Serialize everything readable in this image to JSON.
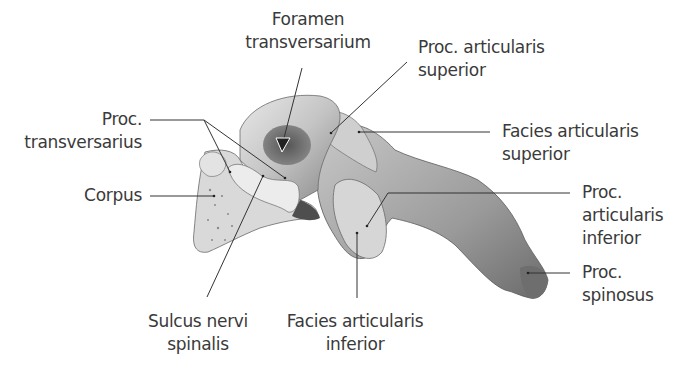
{
  "figure": {
    "colors": {
      "background": "#ffffff",
      "text": "#3a3a3a",
      "leader_line": "#333333",
      "bone_light": "#e6e6e6",
      "bone_mid": "#b8b8b8",
      "bone_dark": "#6e6e6e"
    }
  },
  "labels": {
    "foramen_transversarium": {
      "line1": "Foramen",
      "line2": "transversarium"
    },
    "proc_articularis_superior": {
      "line1": "Proc. articularis",
      "line2": "superior"
    },
    "proc_transversarius": {
      "line1": "Proc.",
      "line2": "transversarius"
    },
    "facies_articularis_superior": {
      "line1": "Facies articularis",
      "line2": "superior"
    },
    "corpus": {
      "line1": "Corpus"
    },
    "proc_articularis_inferior": {
      "line1": "Proc.",
      "line2": "articularis",
      "line3": "inferior"
    },
    "proc_spinosus": {
      "line1": "Proc.",
      "line2": "spinosus"
    },
    "sulcus_nervi_spinalis": {
      "line1": "Sulcus nervi",
      "line2": "spinalis"
    },
    "facies_articularis_inferior": {
      "line1": "Facies articularis",
      "line2": "inferior"
    }
  }
}
